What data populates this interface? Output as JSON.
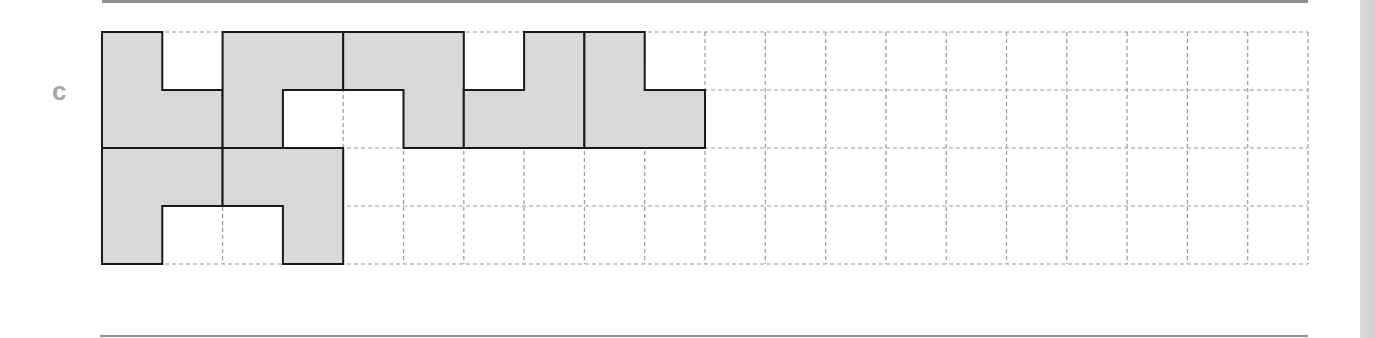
{
  "label": "c",
  "grid": {
    "origin_x": 102,
    "origin_y": 32,
    "cols": 20,
    "rows": 4,
    "cell_w": 60.3,
    "cell_h": 58,
    "dash_color": "#9a9a9a"
  },
  "colors": {
    "shape_fill": "#d9d9d9",
    "shape_stroke": "#1a1a1a",
    "rule": "#8f8f8f",
    "label": "#a8a8a8"
  },
  "shapes": [
    {
      "name": "shape-1",
      "points": [
        [
          0,
          0
        ],
        [
          1,
          0
        ],
        [
          1,
          1
        ],
        [
          2,
          1
        ],
        [
          2,
          2
        ],
        [
          0,
          2
        ]
      ]
    },
    {
      "name": "shape-2",
      "points": [
        [
          2,
          0
        ],
        [
          4,
          0
        ],
        [
          4,
          1
        ],
        [
          3,
          1
        ],
        [
          3,
          2
        ],
        [
          2,
          2
        ]
      ]
    },
    {
      "name": "shape-3",
      "points": [
        [
          4,
          0
        ],
        [
          6,
          0
        ],
        [
          6,
          2
        ],
        [
          5,
          2
        ],
        [
          5,
          1
        ],
        [
          4,
          1
        ]
      ]
    },
    {
      "name": "shape-4",
      "points": [
        [
          7,
          0
        ],
        [
          8,
          0
        ],
        [
          8,
          2
        ],
        [
          6,
          2
        ],
        [
          6,
          1
        ],
        [
          7,
          1
        ]
      ]
    },
    {
      "name": "shape-5",
      "points": [
        [
          8,
          0
        ],
        [
          9,
          0
        ],
        [
          9,
          1
        ],
        [
          10,
          1
        ],
        [
          10,
          2
        ],
        [
          8,
          2
        ]
      ]
    },
    {
      "name": "shape-6",
      "points": [
        [
          0,
          2
        ],
        [
          2,
          2
        ],
        [
          2,
          3
        ],
        [
          1,
          3
        ],
        [
          1,
          4
        ],
        [
          0,
          4
        ]
      ]
    },
    {
      "name": "shape-7",
      "points": [
        [
          2,
          2
        ],
        [
          4,
          2
        ],
        [
          4,
          4
        ],
        [
          3,
          4
        ],
        [
          3,
          3
        ],
        [
          2,
          3
        ]
      ]
    }
  ]
}
